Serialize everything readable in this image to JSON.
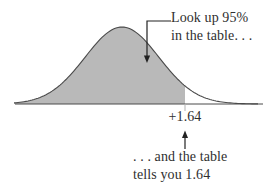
{
  "figure": {
    "annotation_top": {
      "line1": "Look up 95%",
      "line2": "in the table. . ."
    },
    "axis_label": "+1.64",
    "annotation_bottom": {
      "line1": ". . . and the table",
      "line2": "tells you 1.64"
    },
    "colors": {
      "area_fill": "#b9b9b9",
      "curve_stroke": "#4a4a4a",
      "axis": "#4a4a4a",
      "tick": "#b3b3b3",
      "arrow": "#222222",
      "text": "#2f2f2f",
      "background": "#ffffff"
    }
  },
  "chart_data": {
    "type": "area",
    "title": "",
    "x_ticks": [
      "+1.64"
    ],
    "shaded_area_fraction": 0.95,
    "z_cutoff": 1.64,
    "axis_visible": true,
    "grid": false,
    "annotations": [
      "Look up 95% in the table. . .",
      ". . . and the table tells you 1.64"
    ]
  }
}
